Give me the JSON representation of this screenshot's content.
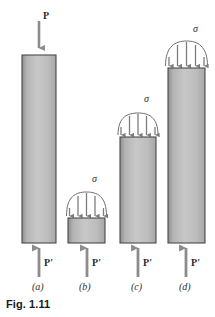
{
  "figure": {
    "caption": "Fig. 1.11",
    "background_color": "#ffffff",
    "ink_color": "#2b2b2b",
    "bar_fill_light": "#c9c9c9",
    "bar_fill_dark": "#9a9a9a",
    "bar_stroke": "#4a4a4a",
    "arrow_color": "#8c8c8c",
    "line_color": "#6e6e6e"
  },
  "labels": {
    "applied_load_top": "P",
    "applied_load_bottom": "P'",
    "stress": "σ"
  },
  "panels": [
    {
      "id": "a",
      "part_label": "(a)",
      "top_label": "P",
      "top_label_kind": "point-load",
      "bottom_label": "P'",
      "has_stress_distribution": false,
      "stress_label": null,
      "bar": {
        "x": 22,
        "y": 55,
        "width": 34,
        "height": 188
      },
      "part_label_pos": {
        "x": 33,
        "y": 287
      }
    },
    {
      "id": "b",
      "part_label": "(b)",
      "top_label": "σ",
      "top_label_kind": "distributed-stress",
      "bottom_label": "P'",
      "has_stress_distribution": true,
      "stress_label": "σ",
      "bar": {
        "x": 68,
        "y": 218,
        "width": 37,
        "height": 25
      },
      "arch": {
        "cx": 86.5,
        "base_y": 216,
        "half_width": 20,
        "rise": 24
      },
      "stress_arrow_count": 5,
      "part_label_pos": {
        "x": 79,
        "y": 287
      }
    },
    {
      "id": "c",
      "part_label": "(c)",
      "top_label": "σ",
      "top_label_kind": "distributed-stress",
      "bottom_label": "P'",
      "has_stress_distribution": true,
      "stress_label": "σ",
      "bar": {
        "x": 120,
        "y": 137,
        "width": 36,
        "height": 106
      },
      "arch": {
        "cx": 138,
        "base_y": 135,
        "half_width": 20,
        "rise": 22
      },
      "stress_arrow_count": 5,
      "part_label_pos": {
        "x": 131,
        "y": 287
      }
    },
    {
      "id": "d",
      "part_label": "(d)",
      "top_label": "σ",
      "top_label_kind": "distributed-stress",
      "bottom_label": "P'",
      "has_stress_distribution": true,
      "stress_label": "σ",
      "bar": {
        "x": 168,
        "y": 68,
        "width": 37,
        "height": 175
      },
      "arch": {
        "cx": 186.5,
        "base_y": 66,
        "half_width": 21,
        "rise": 25
      },
      "stress_arrow_count": 5,
      "part_label_pos": {
        "x": 179,
        "y": 287
      }
    }
  ],
  "annotations": {
    "top_load_label_pos": {
      "x": 38,
      "y": 13
    },
    "sigma_positions": [
      {
        "panel": "b",
        "x": 93,
        "y": 177
      },
      {
        "panel": "c",
        "x": 145,
        "y": 97
      },
      {
        "panel": "d",
        "x": 194,
        "y": 27
      }
    ],
    "bottom_load_positions": [
      {
        "panel": "a",
        "x": 40,
        "y": 263
      },
      {
        "panel": "b",
        "x": 90,
        "y": 263
      },
      {
        "panel": "c",
        "x": 142,
        "y": 263
      },
      {
        "panel": "d",
        "x": 190,
        "y": 263
      }
    ],
    "caption_pos": {
      "x": 6,
      "y": 299
    }
  }
}
